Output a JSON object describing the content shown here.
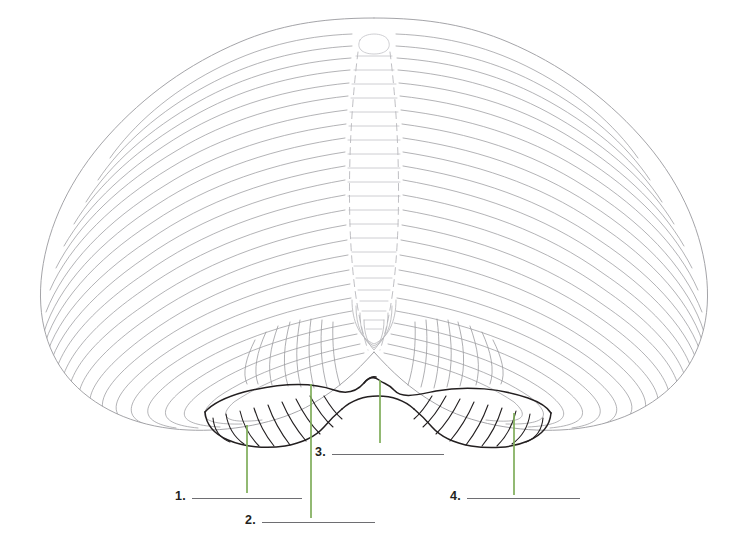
{
  "document": {
    "title": "Cerebellum Labeling Worksheet",
    "figure_caption": "",
    "view": "posterior-inferior view of the cerebellum"
  },
  "canvas": {
    "width": 748,
    "height": 545,
    "background_color": "#ffffff"
  },
  "colors": {
    "folia_line": "#9a9a9e",
    "folia_line_light": "#c2c2c6",
    "tonsil_outline": "#231f20",
    "pointer_green": "#7fad5a",
    "answer_rule": "#6e6e72",
    "label_text": "#231f20"
  },
  "figure": {
    "name": "cerebellum-diagram",
    "parts": [
      {
        "name": "left-cerebellar-hemisphere"
      },
      {
        "name": "right-cerebellar-hemisphere"
      },
      {
        "name": "vermis"
      },
      {
        "name": "left-cerebellar-tonsil"
      },
      {
        "name": "right-cerebellar-tonsil"
      }
    ]
  },
  "pointers": [
    {
      "id": "pointer-1",
      "for_label": "1",
      "x": 247,
      "y_top": 425,
      "y_bottom": 493
    },
    {
      "id": "pointer-2",
      "for_label": "2",
      "x": 311,
      "y_top": 384,
      "y_bottom": 518
    },
    {
      "id": "pointer-3",
      "for_label": "3",
      "x": 380,
      "y_top": 380,
      "y_bottom": 443
    },
    {
      "id": "pointer-4",
      "for_label": "4",
      "x": 514,
      "y_top": 413,
      "y_bottom": 495
    }
  ],
  "answers": [
    {
      "number": "1.",
      "value": "",
      "placeholder": "",
      "left": 175,
      "top": 489,
      "rule_width": 110
    },
    {
      "number": "2.",
      "value": "",
      "placeholder": "",
      "left": 245,
      "top": 513,
      "rule_width": 113
    },
    {
      "number": "3.",
      "value": "",
      "placeholder": "",
      "left": 315,
      "top": 445,
      "rule_width": 112
    },
    {
      "number": "4.",
      "value": "",
      "placeholder": "",
      "left": 450,
      "top": 489,
      "rule_width": 113
    }
  ]
}
